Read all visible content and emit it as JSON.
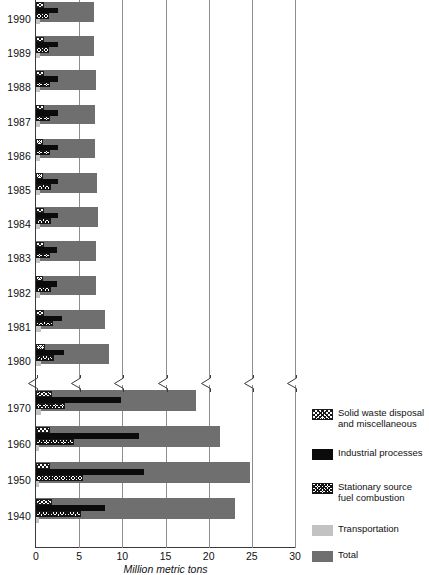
{
  "chart_data": {
    "type": "bar",
    "orientation": "horizontal",
    "title": "",
    "xlabel": "Million metric tons",
    "ylabel": "",
    "xlim": [
      0,
      30
    ],
    "xticks": [
      0,
      5,
      10,
      15,
      20,
      25,
      30
    ],
    "xtick_labels": [
      "0",
      "5",
      "10",
      "15",
      "20",
      "25",
      "30"
    ],
    "grid": true,
    "axis_break": {
      "present": true,
      "between_categories": [
        "1980",
        "1970"
      ],
      "note": "zigzag break across the value axis between the 1980 and 1970 rows"
    },
    "legend_position": "right",
    "categories": [
      "1990",
      "1989",
      "1988",
      "1987",
      "1986",
      "1985",
      "1984",
      "1983",
      "1982",
      "1981",
      "1980",
      "1970",
      "1960",
      "1950",
      "1940"
    ],
    "series": [
      {
        "name": "Solid waste disposal and miscellaneous",
        "pattern": "diagonal-crosshatch",
        "values": [
          0.9,
          0.9,
          0.9,
          0.9,
          0.8,
          0.8,
          0.9,
          0.9,
          0.8,
          0.9,
          1.0,
          1.8,
          1.6,
          1.6,
          1.8
        ]
      },
      {
        "name": "Industrial processes",
        "pattern": "solid-black",
        "values": [
          2.5,
          2.5,
          2.6,
          2.5,
          2.5,
          2.5,
          2.6,
          2.4,
          2.4,
          3.0,
          3.2,
          9.8,
          11.9,
          12.5,
          8.0
        ]
      },
      {
        "name": "Stationary source fuel combustion",
        "pattern": "fine-crosshatch",
        "values": [
          1.5,
          1.5,
          1.6,
          1.6,
          1.6,
          1.7,
          1.7,
          1.6,
          1.7,
          2.0,
          2.1,
          3.4,
          4.4,
          5.5,
          5.2
        ]
      },
      {
        "name": "Transportation",
        "pattern": "light-gray",
        "values": [
          0.5,
          0.5,
          0.5,
          0.5,
          0.5,
          0.5,
          0.5,
          0.5,
          0.5,
          0.6,
          0.6,
          0.6,
          0.4,
          0.3,
          0.3
        ]
      },
      {
        "name": "Total",
        "pattern": "dark-gray",
        "values": [
          6.7,
          6.7,
          6.9,
          6.8,
          6.8,
          7.1,
          7.2,
          6.9,
          7.0,
          8.0,
          8.4,
          18.5,
          21.3,
          24.8,
          23.0
        ]
      }
    ]
  },
  "axis": {
    "x_title": "Million metric tons",
    "tick_labels": [
      "0",
      "5",
      "10",
      "15",
      "20",
      "25",
      "30"
    ]
  },
  "legend": {
    "items": [
      {
        "label_line1": "Solid waste disposal",
        "label_line2": "and miscellaneous",
        "swatch": "diagonal-crosshatch-swatch"
      },
      {
        "label_line1": "Industrial processes",
        "label_line2": "",
        "swatch": "solid-black-swatch"
      },
      {
        "label_line1": "Stationary source",
        "label_line2": "fuel combustion",
        "swatch": "fine-crosshatch-swatch"
      },
      {
        "label_line1": "Transportation",
        "label_line2": "",
        "swatch": "light-gray-swatch"
      },
      {
        "label_line1": "Total",
        "label_line2": "",
        "swatch": "dark-gray-swatch"
      }
    ]
  },
  "colors": {
    "total": "#6f6f6f",
    "transportation": "#c2c2c2",
    "industrial": "#0b0b0b",
    "gridline": "#8d8d8d",
    "axis": "#3a3a3a",
    "text": "#111111",
    "background": "#ffffff"
  }
}
